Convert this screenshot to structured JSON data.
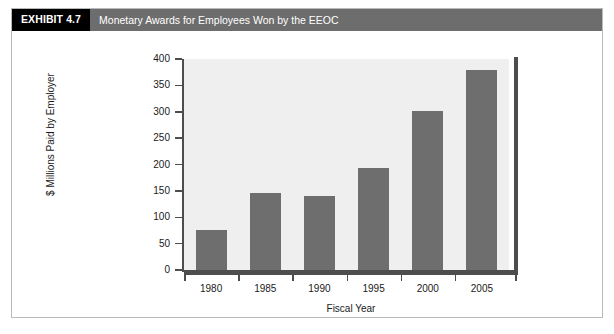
{
  "exhibit": {
    "tag": "EXHIBIT 4.7",
    "title": "Monetary Awards for Employees Won by the EEOC"
  },
  "chart_data": {
    "type": "bar",
    "title": "Monetary Awards for Employees Won by the EEOC",
    "categories": [
      "1980",
      "1985",
      "1990",
      "1995",
      "2000",
      "2005"
    ],
    "values": [
      75,
      146,
      140,
      194,
      302,
      380
    ],
    "xlabel": "Fiscal Year",
    "ylabel": "$ Millions Paid by Employer",
    "ylim": [
      0,
      400
    ],
    "ytick_labels": [
      "0",
      "50",
      "100",
      "150",
      "200",
      "250",
      "300",
      "350",
      "400"
    ],
    "ytick_values": [
      0,
      50,
      100,
      150,
      200,
      250,
      300,
      350,
      400
    ],
    "grid": false,
    "legend": "none",
    "bar_color": "#6e6e6e",
    "plot_background": "#efefef",
    "axis_color": "#4d4d4d"
  }
}
